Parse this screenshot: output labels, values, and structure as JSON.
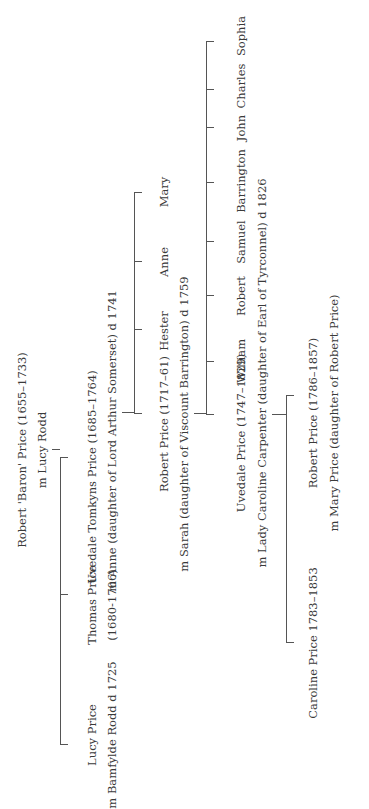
{
  "root": {
    "name": "Robert 'Baron' Price (1655–1733)",
    "spouse": "m Lucy Rodd"
  },
  "generation1": [
    {
      "name": "Lucy Price",
      "spouse": "m Bamfylde Rodd d 1725"
    },
    {
      "name": "Thomas Price",
      "dates": "(1680-1706)"
    },
    {
      "name": "Uvedale Tomkyns Price (1685–1764)",
      "spouse": "m Anne (daughter of Lord Arthur Somerset) d 1741"
    }
  ],
  "generation2": [
    {
      "name": "Robert Price (1717–61)",
      "spouse": "m Sarah (daughter of Viscount Barrington) d 1759"
    },
    {
      "name": "Hester"
    },
    {
      "name": "Anne"
    },
    {
      "name": "Mary"
    }
  ],
  "generation3": [
    {
      "name": "Uvedale Price (1747–1829)",
      "spouse": "m Lady Caroline Carpenter (daughter of Earl of Tyrconnel) d 1826"
    },
    {
      "name": "William"
    },
    {
      "name": "Robert"
    },
    {
      "name": "Samuel"
    },
    {
      "name": "Barrington"
    },
    {
      "name": "John"
    },
    {
      "name": "Charles"
    },
    {
      "name": "Sophia"
    }
  ],
  "generation4": [
    {
      "name": "Caroline Price 1783–1853"
    },
    {
      "name": "Robert Price (1786–1857)",
      "spouse": "m Mary Price (daughter of Robert Price)"
    }
  ],
  "colors": {
    "line": "#555555",
    "text": "#3a3a3a",
    "background": "#ffffff"
  }
}
